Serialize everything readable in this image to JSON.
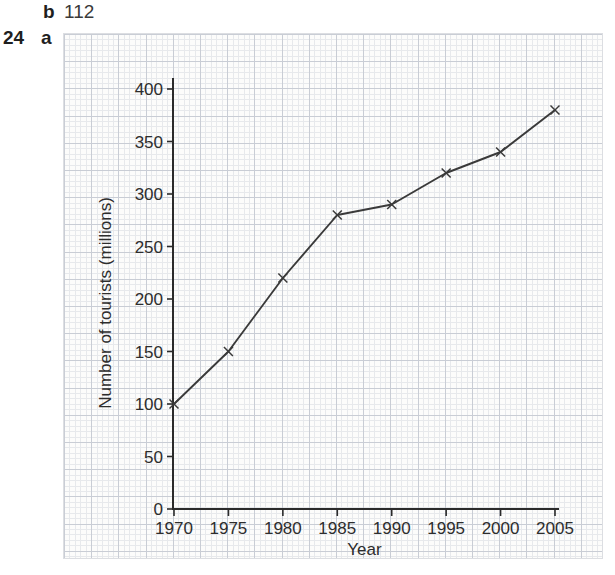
{
  "page": {
    "prev_answer": {
      "part_label": "b",
      "value": "112"
    },
    "question": {
      "number": "24",
      "part_label": "a"
    }
  },
  "chart_data": {
    "type": "line",
    "title": "",
    "xlabel": "Year",
    "ylabel": "Number of tourists (millions)",
    "categories": [
      "1970",
      "1975",
      "1980",
      "1985",
      "1990",
      "1995",
      "2000",
      "2005"
    ],
    "values": [
      100,
      150,
      220,
      280,
      290,
      320,
      340,
      380
    ],
    "series": [
      {
        "name": "Number of tourists (millions)",
        "values": [
          100,
          150,
          220,
          280,
          290,
          320,
          340,
          380
        ]
      }
    ],
    "ylim": [
      0,
      400
    ],
    "yticks": [
      0,
      50,
      100,
      150,
      200,
      250,
      300,
      350,
      400
    ],
    "xlim": [
      1970,
      2005
    ],
    "marker": "x",
    "grid": "graph-paper",
    "legend_position": "none",
    "colors": {
      "line": "#3a3a3a",
      "axis": "#2b2b2b",
      "tick_text": "#2d2d2d",
      "paper": "#fcfcfb"
    }
  }
}
